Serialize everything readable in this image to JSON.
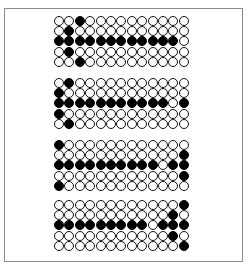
{
  "figure": {
    "rows": 5,
    "cols": 13,
    "colors": {
      "filled": "#000000",
      "empty": "#ffffff",
      "outline": "#111111",
      "frame": "#8a8a8a"
    },
    "grids": [
      {
        "top": 16,
        "filled": [
          [
            0,
            2
          ],
          [
            1,
            1
          ],
          [
            2,
            0
          ],
          [
            2,
            1
          ],
          [
            2,
            2
          ],
          [
            2,
            3
          ],
          [
            2,
            4
          ],
          [
            2,
            5
          ],
          [
            2,
            6
          ],
          [
            2,
            7
          ],
          [
            2,
            8
          ],
          [
            2,
            9
          ],
          [
            2,
            10
          ],
          [
            2,
            11
          ],
          [
            3,
            1
          ],
          [
            4,
            2
          ]
        ]
      },
      {
        "top": 78,
        "filled": [
          [
            0,
            1
          ],
          [
            1,
            0
          ],
          [
            2,
            0
          ],
          [
            2,
            1
          ],
          [
            2,
            2
          ],
          [
            2,
            3
          ],
          [
            2,
            4
          ],
          [
            2,
            5
          ],
          [
            2,
            6
          ],
          [
            2,
            7
          ],
          [
            2,
            8
          ],
          [
            2,
            9
          ],
          [
            2,
            10
          ],
          [
            2,
            12
          ],
          [
            3,
            0
          ],
          [
            4,
            1
          ]
        ]
      },
      {
        "top": 140,
        "filled": [
          [
            0,
            0
          ],
          [
            1,
            12
          ],
          [
            2,
            0
          ],
          [
            2,
            1
          ],
          [
            2,
            2
          ],
          [
            2,
            3
          ],
          [
            2,
            4
          ],
          [
            2,
            5
          ],
          [
            2,
            6
          ],
          [
            2,
            7
          ],
          [
            2,
            8
          ],
          [
            2,
            9
          ],
          [
            2,
            11
          ],
          [
            2,
            12
          ],
          [
            3,
            12
          ],
          [
            4,
            0
          ]
        ]
      },
      {
        "top": 200,
        "filled": [
          [
            0,
            12
          ],
          [
            1,
            11
          ],
          [
            2,
            0
          ],
          [
            2,
            1
          ],
          [
            2,
            2
          ],
          [
            2,
            3
          ],
          [
            2,
            4
          ],
          [
            2,
            5
          ],
          [
            2,
            6
          ],
          [
            2,
            7
          ],
          [
            2,
            8
          ],
          [
            2,
            10
          ],
          [
            2,
            11
          ],
          [
            2,
            12
          ],
          [
            3,
            11
          ],
          [
            4,
            12
          ]
        ]
      }
    ]
  }
}
